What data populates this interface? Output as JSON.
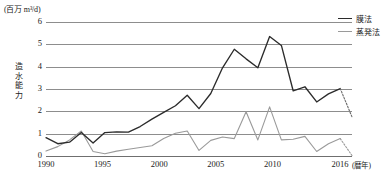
{
  "axes": {
    "y_unit_label": "(百万 m³/d)",
    "y_axis_title": "造水能力",
    "y_ticks": [
      "0",
      "1",
      "2",
      "3",
      "4",
      "5",
      "6"
    ],
    "x_ticks": [
      "1990",
      "1995",
      "2000",
      "2005",
      "2010",
      "2016"
    ],
    "x_unit_label": "(暦年)"
  },
  "legend": {
    "items": [
      {
        "label": "膜法",
        "color": "#2b2b2b",
        "swatch": "membrane"
      },
      {
        "label": "蒸発法",
        "color": "#9a9a9a",
        "swatch": "evaporation"
      }
    ]
  },
  "chart_data": {
    "type": "line",
    "title": "",
    "xlabel": "(暦年)",
    "ylabel": "造水能力 (百万 m³/d)",
    "xlim": [
      1990,
      2016
    ],
    "ylim": [
      0,
      6
    ],
    "grid": true,
    "legend_position": "top-right",
    "x": [
      1990,
      1991,
      1992,
      1993,
      1994,
      1995,
      1996,
      1997,
      1998,
      1999,
      2000,
      2001,
      2002,
      2003,
      2004,
      2005,
      2006,
      2007,
      2008,
      2009,
      2010,
      2011,
      2012,
      2013,
      2014,
      2015,
      2016
    ],
    "series": [
      {
        "name": "膜法",
        "color": "#2b2b2b",
        "values": [
          0.82,
          0.55,
          0.62,
          1.05,
          0.58,
          1.05,
          1.08,
          1.07,
          1.32,
          1.65,
          1.95,
          2.25,
          2.72,
          2.12,
          2.8,
          3.95,
          4.78,
          4.35,
          3.95,
          5.35,
          4.95,
          2.92,
          3.1,
          2.42,
          2.78,
          3.02,
          1.75
        ],
        "dashed_from_index": 25
      },
      {
        "name": "蒸発法",
        "color": "#9a9a9a",
        "values": [
          0.22,
          0.42,
          0.72,
          1.12,
          0.2,
          0.1,
          0.22,
          0.3,
          0.38,
          0.46,
          0.78,
          1.02,
          1.12,
          0.25,
          0.7,
          0.85,
          0.78,
          1.98,
          0.72,
          2.2,
          0.72,
          0.75,
          0.88,
          0.2,
          0.55,
          0.78,
          0.02
        ],
        "dashed_from_index": 25,
        "tail_values": [
          0.02,
          0.05,
          0.25
        ]
      }
    ]
  }
}
